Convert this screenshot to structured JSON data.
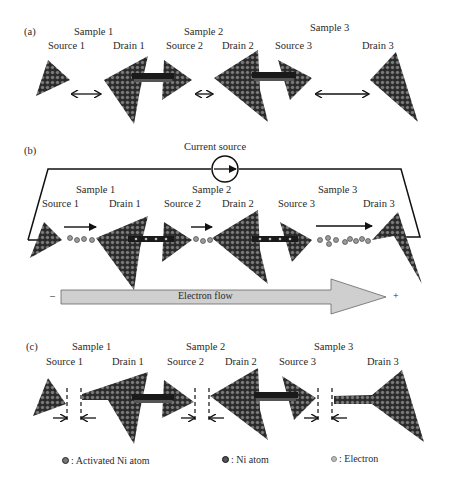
{
  "panels": [
    {
      "tag": "(a)",
      "samples": [
        "Sample 1",
        "Sample 2",
        "Sample 3"
      ],
      "electrodes": [
        "Source 1",
        "Drain 1",
        "Source 2",
        "Drain 2",
        "Source 3",
        "Drain 3"
      ]
    },
    {
      "tag": "(b)",
      "current_source_label": "Current source",
      "samples": [
        "Sample 1",
        "Sample 2",
        "Sample 3"
      ],
      "electrodes": [
        "Source 1",
        "Drain 1",
        "Source 2",
        "Drain 2",
        "Source 3",
        "Drain 3"
      ],
      "electron_flow": {
        "label": "Electron flow",
        "minus": "–",
        "plus": "+"
      }
    },
    {
      "tag": "(c)",
      "samples": [
        "Sample 1",
        "Sample 2",
        "Sample 3"
      ],
      "electrodes": [
        "Source 1",
        "Drain 1",
        "Source 2",
        "Drain 2",
        "Source 3",
        "Drain 3"
      ]
    }
  ],
  "legend": [
    {
      "label": ": Activated Ni atom",
      "icon": "activated-ni-atom-icon",
      "color": "#555555"
    },
    {
      "label": ": Ni atom",
      "icon": "ni-atom-icon",
      "color": "#3d3d3d"
    },
    {
      "label": ": Electron",
      "icon": "electron-icon",
      "color": "#a0a0a0"
    }
  ],
  "colors": {
    "atom_fill": "#6e6e6e",
    "atom_stroke": "#1e1e1e",
    "bridge": "#222222",
    "flow_arrow": "#cfcfcf"
  }
}
